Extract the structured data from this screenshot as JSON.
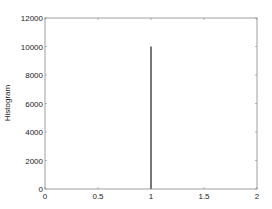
{
  "chart_data": {
    "type": "bar",
    "title": "",
    "xlabel": "",
    "ylabel": "Histogram",
    "xlim": [
      0,
      2
    ],
    "ylim": [
      0,
      12000
    ],
    "xticks": [
      0,
      0.5,
      1,
      1.5,
      2
    ],
    "xtick_labels": [
      "0",
      "0.5",
      "1",
      "1.5",
      "2"
    ],
    "yticks": [
      0,
      2000,
      4000,
      6000,
      8000,
      10000,
      12000
    ],
    "ytick_labels": [
      "0",
      "2000",
      "4000",
      "6000",
      "8000",
      "10000",
      "12000"
    ],
    "grid": false,
    "legend": null,
    "x": [
      1
    ],
    "values": [
      10000
    ],
    "bar_color": "#555555",
    "axis_color": "#888888"
  }
}
